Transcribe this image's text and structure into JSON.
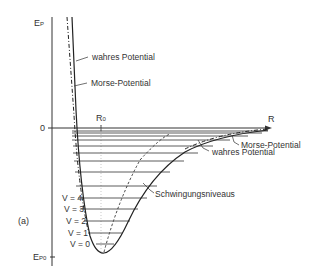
{
  "diagram": {
    "panel_label": "(a)",
    "axes": {
      "y_label": "E",
      "y_label_sub": "P",
      "x_label": "R",
      "zero_label": "0",
      "r0_label": "R",
      "r0_sub": "0",
      "ep0_label": "E",
      "ep0_sub": "P0"
    },
    "annotations": {
      "true_potential_upper": "wahres Potential",
      "morse_potential_upper": "Morse-Potential",
      "morse_potential_right": "Morse-Potential",
      "true_potential_right": "wahres Potential",
      "vibrational_levels": "Schwingungsniveaus"
    },
    "levels": [
      {
        "label": "V = 0"
      },
      {
        "label": "V = 1"
      },
      {
        "label": "V = 2"
      },
      {
        "label": "V = 3"
      },
      {
        "label": "V = 4"
      }
    ],
    "colors": {
      "line": "#222222",
      "grid": "#bbbbbb"
    }
  }
}
